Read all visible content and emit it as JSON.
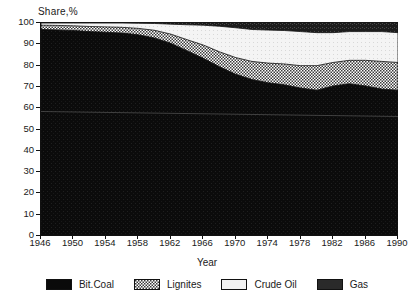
{
  "chart_data": {
    "type": "area",
    "stacked": true,
    "title": "",
    "xlabel": "Year",
    "ylabel": "Share,%",
    "xlim": [
      1946,
      1990
    ],
    "ylim": [
      0,
      100
    ],
    "grid": false,
    "legend_position": "bottom",
    "xticks": [
      1946,
      1950,
      1954,
      1958,
      1962,
      1966,
      1970,
      1974,
      1978,
      1982,
      1986,
      1990
    ],
    "yticks": [
      0,
      10,
      20,
      30,
      40,
      50,
      60,
      70,
      80,
      90,
      100
    ],
    "x": [
      1946,
      1948,
      1950,
      1952,
      1954,
      1956,
      1958,
      1960,
      1962,
      1964,
      1966,
      1968,
      1970,
      1972,
      1974,
      1976,
      1978,
      1980,
      1982,
      1984,
      1986,
      1988,
      1990
    ],
    "series": [
      {
        "name": "Bit.Coal",
        "color": "#0a0a0a",
        "pattern": "solid",
        "values": [
          96.5,
          96.3,
          96.0,
          95.5,
          95.2,
          94.8,
          94.0,
          92.5,
          90.0,
          86.5,
          83.0,
          79.0,
          75.5,
          73.0,
          71.5,
          70.5,
          69.0,
          68.0,
          70.0,
          71.0,
          70.0,
          68.5,
          68.0
        ]
      },
      {
        "name": "Lignites",
        "color": "#8a8a8a",
        "pattern": "crosshatch",
        "values": [
          2.0,
          2.1,
          2.2,
          2.4,
          2.5,
          2.7,
          3.0,
          3.6,
          4.3,
          5.2,
          6.2,
          7.0,
          7.8,
          8.5,
          9.2,
          9.8,
          10.5,
          11.5,
          11.0,
          11.0,
          12.0,
          13.0,
          13.0
        ]
      },
      {
        "name": "Crude Oil",
        "color": "#f2f2f2",
        "pattern": "light",
        "values": [
          1.0,
          1.1,
          1.3,
          1.6,
          1.8,
          2.0,
          2.4,
          3.2,
          4.7,
          7.0,
          9.3,
          12.0,
          14.0,
          15.0,
          15.5,
          15.7,
          16.0,
          15.5,
          14.0,
          13.5,
          13.5,
          14.0,
          14.0
        ]
      },
      {
        "name": "Gas",
        "color": "#2a2a2a",
        "pattern": "dark-noise",
        "values": [
          0.5,
          0.5,
          0.5,
          0.5,
          0.5,
          0.5,
          0.6,
          0.7,
          1.0,
          1.3,
          1.5,
          2.0,
          2.7,
          3.5,
          3.8,
          4.0,
          4.5,
          5.0,
          5.0,
          4.5,
          4.5,
          4.5,
          5.0
        ]
      }
    ],
    "cumulative_tops": {
      "bitcoal": [
        96.5,
        96.3,
        96.0,
        95.5,
        95.2,
        94.8,
        94.0,
        92.5,
        90.0,
        86.5,
        83.0,
        79.0,
        75.5,
        73.0,
        71.5,
        70.5,
        69.0,
        68.0,
        70.0,
        71.0,
        70.0,
        68.5,
        68.0
      ],
      "lignites": [
        98.5,
        98.4,
        98.2,
        97.9,
        97.7,
        97.5,
        97.0,
        96.1,
        94.3,
        91.7,
        89.2,
        86.0,
        83.3,
        81.5,
        80.7,
        80.3,
        79.5,
        79.5,
        81.0,
        82.0,
        82.0,
        81.5,
        81.0
      ],
      "crudeoil": [
        99.5,
        99.5,
        99.5,
        99.5,
        99.5,
        99.5,
        99.4,
        99.3,
        99.0,
        98.7,
        98.5,
        98.0,
        97.3,
        96.5,
        96.2,
        96.0,
        95.5,
        95.0,
        95.0,
        95.5,
        95.5,
        95.5,
        95.0
      ],
      "gas": [
        100,
        100,
        100,
        100,
        100,
        100,
        100,
        100,
        100,
        100,
        100,
        100,
        100,
        100,
        100,
        100,
        100,
        100,
        100,
        100,
        100,
        100,
        100
      ]
    }
  },
  "legend": {
    "items": [
      {
        "label": "Bit.Coal"
      },
      {
        "label": "Lignites"
      },
      {
        "label": "Crude Oil"
      },
      {
        "label": "Gas"
      }
    ]
  }
}
